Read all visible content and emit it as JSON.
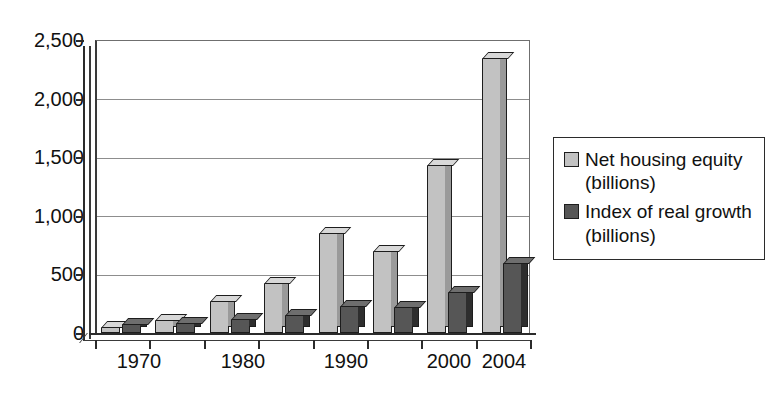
{
  "chart_data": {
    "type": "bar",
    "title": "",
    "subtitle": "",
    "xlabel": "",
    "ylabel": "",
    "ylim": [
      0,
      2500
    ],
    "yticks": [
      0,
      500,
      1000,
      1500,
      2000,
      2500
    ],
    "ytick_labels": [
      "0",
      "500",
      "1,000",
      "1,500",
      "2,000",
      "2,500"
    ],
    "grid": true,
    "legend_position": "right",
    "style": "3d-column",
    "categories": [
      "1970",
      "1975",
      "1980",
      "1985",
      "1990",
      "1995",
      "2000",
      "2004"
    ],
    "xtick_labels": [
      "1970",
      "1980",
      "1990",
      "2000",
      "2004"
    ],
    "series": [
      {
        "name": "Net housing equity (billions)",
        "color": "#c2c2c2",
        "values": [
          50,
          110,
          270,
          430,
          850,
          700,
          1430,
          2350
        ]
      },
      {
        "name": "Index of real growth (billions)",
        "color": "#565656",
        "values": [
          80,
          85,
          120,
          150,
          230,
          220,
          350,
          600
        ]
      }
    ]
  },
  "axis": {
    "y_labels": [
      "2,500",
      "2,000",
      "1,500",
      "1,000",
      "500",
      "0"
    ],
    "x_labels": [
      "1970",
      "1980",
      "1990",
      "2000",
      "2004"
    ]
  },
  "legend": {
    "items": [
      {
        "label": "Net housing equity (billions)",
        "swatch_color": "#c2c2c2"
      },
      {
        "label": "Index of real growth (billions)",
        "swatch_color": "#565656"
      }
    ]
  }
}
